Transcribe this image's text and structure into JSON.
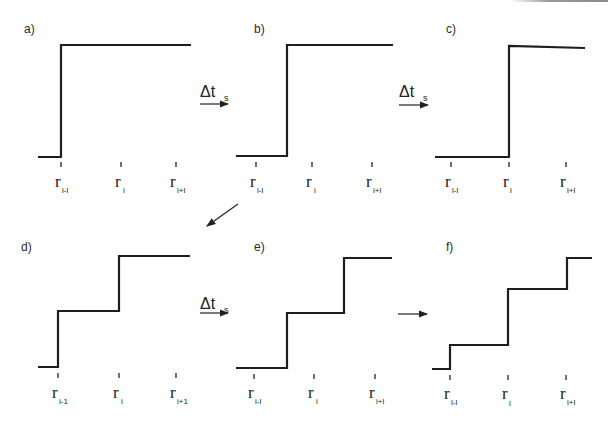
{
  "figure": {
    "panels": [
      {
        "id": "a",
        "label": "a)",
        "steps_at": [
          "r_{i-1}"
        ],
        "ticks": [
          {
            "main": "r",
            "sub": "i-l"
          },
          {
            "main": "r",
            "sub": "i"
          },
          {
            "main": "r",
            "sub": "i+l"
          }
        ]
      },
      {
        "id": "b",
        "label": "b)",
        "steps_at": [
          "between r_{i-1} and r_i"
        ],
        "ticks": [
          {
            "main": "r",
            "sub": "i-l"
          },
          {
            "main": "r",
            "sub": "i"
          },
          {
            "main": "r",
            "sub": "i+l"
          }
        ]
      },
      {
        "id": "c",
        "label": "c)",
        "steps_at": [
          "r_i"
        ],
        "ticks": [
          {
            "main": "r",
            "sub": "l-l"
          },
          {
            "main": "r",
            "sub": "i"
          },
          {
            "main": "r",
            "sub": "l+l"
          }
        ]
      },
      {
        "id": "d",
        "label": "d)",
        "steps_at": [
          "r_{i-1}",
          "r_i"
        ],
        "ticks": [
          {
            "main": "r",
            "sub": "i-1"
          },
          {
            "main": "r",
            "sub": "i"
          },
          {
            "main": "r",
            "sub": "i+1"
          }
        ]
      },
      {
        "id": "e",
        "label": "e)",
        "steps_at": [
          "between r_{i-1} and r_i",
          "between r_i and r_{i+1}"
        ],
        "ticks": [
          {
            "main": "r",
            "sub": "i-l"
          },
          {
            "main": "r",
            "sub": "i"
          },
          {
            "main": "r",
            "sub": "i+l"
          }
        ]
      },
      {
        "id": "f",
        "label": "f)",
        "steps_at": [
          "r_{i-1}",
          "r_i",
          "r_{i+1}"
        ],
        "ticks": [
          {
            "main": "r",
            "sub": "l-l"
          },
          {
            "main": "r",
            "sub": "l"
          },
          {
            "main": "r",
            "sub": "i+l"
          }
        ]
      }
    ],
    "transitions": [
      {
        "from": "a",
        "to": "b",
        "label": "Δt",
        "sub": "s"
      },
      {
        "from": "b",
        "to": "c",
        "label": "Δt",
        "sub": "s"
      },
      {
        "from": "c",
        "to": "d",
        "label": ""
      },
      {
        "from": "d",
        "to": "e",
        "label": "Δt",
        "sub": "s"
      },
      {
        "from": "e",
        "to": "f",
        "label": ""
      }
    ]
  }
}
